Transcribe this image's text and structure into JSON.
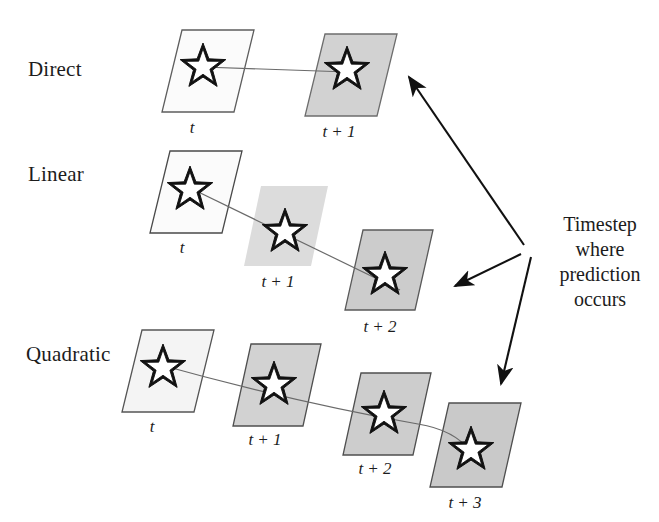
{
  "figure": {
    "background_color": "#ffffff",
    "rows": [
      {
        "name": "direct",
        "label": "Direct",
        "label_x": 28,
        "label_y": 57,
        "line_type": "straight",
        "cells": [
          {
            "step_label": "t",
            "x": 162,
            "y": 30,
            "w": 72,
            "h": 82,
            "skew": 20,
            "fill": "#fbfbfb",
            "stroke": "#5e5e5e",
            "star_cx": 203,
            "star_cy": 67,
            "star_r": 24,
            "label_x": 192,
            "label_y": 118
          },
          {
            "step_label": "t + 1",
            "x": 305,
            "y": 34,
            "w": 72,
            "h": 82,
            "skew": 20,
            "fill": "#d2d2d2",
            "stroke": "#6d6d6d",
            "star_cx": 347,
            "star_cy": 70,
            "star_r": 24,
            "label_x": 339,
            "label_y": 122
          }
        ]
      },
      {
        "name": "linear",
        "label": "Linear",
        "label_x": 28,
        "label_y": 162,
        "line_type": "straight",
        "cells": [
          {
            "step_label": "t",
            "x": 150,
            "y": 151,
            "w": 72,
            "h": 82,
            "skew": 20,
            "fill": "#fbfbfb",
            "stroke": "#4a4a4a",
            "star_cx": 190,
            "star_cy": 190,
            "star_r": 24,
            "label_x": 182,
            "label_y": 238
          },
          {
            "step_label": "t + 1",
            "x": 244,
            "y": 186,
            "w": 67,
            "h": 80,
            "skew": 17,
            "fill": "#dcdcdc",
            "stroke": "none",
            "star_cx": 285,
            "star_cy": 232,
            "star_r": 24,
            "label_x": 278,
            "label_y": 272
          },
          {
            "step_label": "t + 2",
            "x": 345,
            "y": 230,
            "w": 70,
            "h": 80,
            "skew": 18,
            "fill": "#cccccc",
            "stroke": "#5a5a5a",
            "star_cx": 385,
            "star_cy": 275,
            "star_r": 24,
            "label_x": 380,
            "label_y": 317
          }
        ]
      },
      {
        "name": "quadratic",
        "label": "Quadratic",
        "label_x": 26,
        "label_y": 342,
        "line_type": "curved",
        "cells": [
          {
            "step_label": "t",
            "x": 122,
            "y": 330,
            "w": 72,
            "h": 82,
            "skew": 20,
            "fill": "#f4f4f4",
            "stroke": "#555555",
            "star_cx": 163,
            "star_cy": 368,
            "star_r": 24,
            "label_x": 152,
            "label_y": 417
          },
          {
            "step_label": "t + 1",
            "x": 233,
            "y": 344,
            "w": 70,
            "h": 82,
            "skew": 18,
            "fill": "#d2d2d2",
            "stroke": "#4f4f4f",
            "star_cx": 274,
            "star_cy": 385,
            "star_r": 24,
            "label_x": 265,
            "label_y": 430
          },
          {
            "step_label": "t + 2",
            "x": 343,
            "y": 373,
            "w": 70,
            "h": 82,
            "skew": 18,
            "fill": "#cdcdcd",
            "stroke": "#4f4f4f",
            "star_cx": 384,
            "star_cy": 414,
            "star_r": 24,
            "label_x": 375,
            "label_y": 459
          },
          {
            "step_label": "t + 3",
            "x": 430,
            "y": 403,
            "w": 72,
            "h": 84,
            "skew": 19,
            "fill": "#c9c9c9",
            "stroke": "#4f4f4f",
            "star_cx": 471,
            "star_cy": 450,
            "star_r": 24,
            "label_x": 465,
            "label_y": 493
          }
        ]
      }
    ],
    "trajectories": [
      {
        "name": "direct-line",
        "path": "M 203 67 L 348 72"
      },
      {
        "name": "linear-line",
        "path": "M 186 186 L 400 290"
      },
      {
        "name": "quadratic-line",
        "path": "M 150 362 C 250 390, 350 412, 418 424 C 443 428, 460 437, 471 452"
      }
    ],
    "annotation": {
      "hub_x": 528,
      "hub_y": 250,
      "lines": [
        "Timestep",
        "where",
        "prediction",
        "occurs"
      ],
      "text_x": 548,
      "text_y": 212,
      "arrows": [
        {
          "name": "arrow-to-direct",
          "from_x": 524,
          "from_y": 245,
          "to_x": 409,
          "to_y": 77
        },
        {
          "name": "arrow-to-linear",
          "from_x": 521,
          "from_y": 254,
          "to_x": 455,
          "to_y": 286
        },
        {
          "name": "arrow-to-quadratic",
          "from_x": 531,
          "from_y": 257,
          "to_x": 501,
          "to_y": 384
        }
      ]
    },
    "style": {
      "line_color": "#6a6a6a",
      "arrow_color": "#111111",
      "star_stroke": "#111111",
      "star_fill": "#ffffff",
      "text_color": "#1c1c1c"
    }
  }
}
